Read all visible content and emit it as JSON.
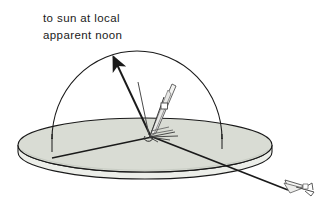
{
  "figure": {
    "caption": {
      "line1": "to sun at local",
      "line2": "apparent noon"
    },
    "labels": {
      "horizon_disc": "horizon plane disc",
      "celestial_dome": "celestial hemisphere",
      "sun_vector": "to sun at local apparent noon",
      "observer_aircraft": "observer aircraft at center",
      "distant_aircraft": "aircraft along ground track",
      "ground_track_line": "ground track line across horizon plane"
    },
    "colors": {
      "outline": "#1a1a1a",
      "disc_top_fill": "#d9dcd4",
      "disc_side_fill": "#eceee9",
      "dome_fill": "#ffffff",
      "aircraft_fill": "#f2f2f0",
      "background": "#ffffff",
      "text": "#1a1a1a"
    },
    "geometry": {
      "disc_center_x": 145,
      "disc_center_y": 145,
      "disc_radius_x": 127,
      "disc_radius_y": 27,
      "disc_thickness": 13,
      "dome_base_y": 138,
      "dome_radius": 85,
      "dome_center_x": 137,
      "sun_arrow_tip_x": 111,
      "sun_arrow_tip_y": 52,
      "origin_x": 152,
      "origin_y": 137
    }
  }
}
